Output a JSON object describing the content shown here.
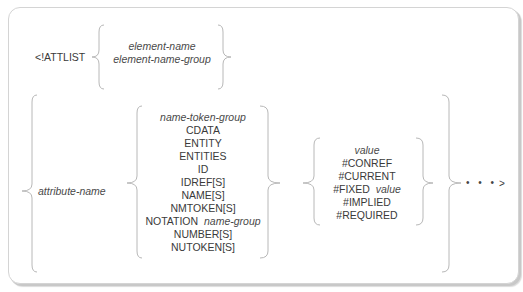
{
  "diagram": {
    "keyword": "<!ATTLIST",
    "element_group": {
      "items": [
        {
          "text": "element-name",
          "italic": true
        },
        {
          "text": "element-name-group",
          "italic": true
        }
      ]
    },
    "attribute_name": "attribute-name",
    "declared_value_group": {
      "items": [
        {
          "text": "name-token-group",
          "italic": true
        },
        {
          "text": "CDATA"
        },
        {
          "text": "ENTITY"
        },
        {
          "text": "ENTITIES"
        },
        {
          "text": "ID"
        },
        {
          "text": "IDREF[S]"
        },
        {
          "text": "NAME[S]"
        },
        {
          "text": "NMTOKEN[S]"
        },
        {
          "text": "NOTATION",
          "suffix": "name-group"
        },
        {
          "text": "NUMBER[S]"
        },
        {
          "text": "NUTOKEN[S]"
        }
      ]
    },
    "default_value_group": {
      "items": [
        {
          "text": "value",
          "italic": true
        },
        {
          "text": "#CONREF"
        },
        {
          "text": "#CURRENT"
        },
        {
          "text": "#FIXED",
          "suffix": "value"
        },
        {
          "text": "#IMPLIED"
        },
        {
          "text": "#REQUIRED"
        }
      ]
    },
    "continuation": "• • •",
    "closing": ">",
    "colors": {
      "brace_stroke": "#b8b8b8",
      "text": "#3a3a3a",
      "frame_border": "#d4d4d4"
    }
  }
}
